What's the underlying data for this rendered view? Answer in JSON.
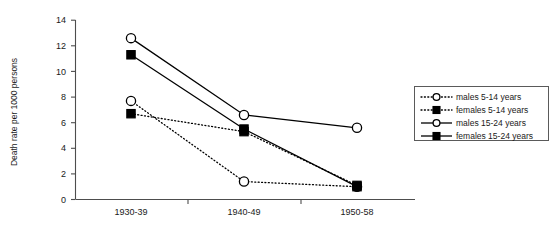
{
  "chart_data": {
    "type": "line",
    "title": "",
    "xlabel": "",
    "ylabel": "Death rate per 1000 persons",
    "categories": [
      "1930-39",
      "1940-49",
      "1950-58"
    ],
    "ylim": [
      0,
      14
    ],
    "yticks": [
      0,
      2,
      4,
      6,
      8,
      10,
      12,
      14
    ],
    "grid": false,
    "legend_position": "right",
    "series": [
      {
        "name": "males 5-14 years",
        "values": [
          7.7,
          1.4,
          1.0
        ],
        "line_style": "dotted",
        "marker": "open-circle",
        "color": "#000000"
      },
      {
        "name": "females 5-14 years",
        "values": [
          6.7,
          5.3,
          1.1
        ],
        "line_style": "dotted",
        "marker": "filled-square",
        "color": "#000000"
      },
      {
        "name": "males 15-24 years",
        "values": [
          12.6,
          6.6,
          5.6
        ],
        "line_style": "solid",
        "marker": "open-circle",
        "color": "#000000"
      },
      {
        "name": "females 15-24 years",
        "values": [
          11.3,
          5.5,
          1.0
        ],
        "line_style": "solid",
        "marker": "filled-square",
        "color": "#000000"
      }
    ]
  },
  "axis": {
    "y_label": "Death rate per 1000 persons",
    "y_tick_0": "0",
    "y_tick_1": "2",
    "y_tick_2": "4",
    "y_tick_3": "6",
    "y_tick_4": "8",
    "y_tick_5": "10",
    "y_tick_6": "12",
    "y_tick_7": "14",
    "x_cat_0": "1930-39",
    "x_cat_1": "1940-49",
    "x_cat_2": "1950-58"
  },
  "legend": {
    "entry_0": "males 5-14 years",
    "entry_1": "females 5-14 years",
    "entry_2": "males 15-24 years",
    "entry_3": "females 15-24 years"
  },
  "colors": {
    "ink": "#000000",
    "axis": "#4d4d4d",
    "legend_border": "#5a5a5a",
    "background": "#ffffff"
  }
}
